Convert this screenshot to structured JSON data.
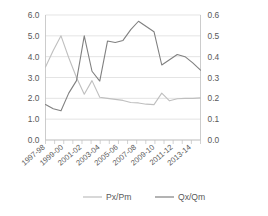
{
  "chart_data": {
    "type": "line",
    "title": "",
    "xlabel": "",
    "ylabel": "",
    "categories": [
      "1997-98",
      "1998-99",
      "1999-00",
      "2000-01",
      "2001-02",
      "2002-03",
      "2003-04",
      "2004-05",
      "2005-06",
      "2006-07",
      "2007-08",
      "2008-09",
      "2009-10",
      "2010-11",
      "2011-12",
      "2012-13",
      "2013-14",
      "2014-15"
    ],
    "x_tick_labels": [
      "1997-98",
      "1999-00",
      "2001-02",
      "2003-04",
      "2005-06",
      "2007-08",
      "2009-10",
      "2011-12",
      "2013-14"
    ],
    "left_axis": {
      "ylim": [
        0.0,
        6.0
      ],
      "ticks": [
        "0.0",
        "1.0",
        "2.0",
        "3.0",
        "4.0",
        "5.0",
        "6.0"
      ],
      "tick_values": [
        0.0,
        1.0,
        2.0,
        3.0,
        4.0,
        5.0,
        6.0
      ]
    },
    "right_axis": {
      "ylim": [
        0.0,
        0.6
      ],
      "ticks": [
        "0.0",
        "0.1",
        "0.2",
        "0.3",
        "0.4",
        "0.5",
        "0.6"
      ],
      "tick_values": [
        0.0,
        0.1,
        0.2,
        0.3,
        0.4,
        0.5,
        0.6
      ]
    },
    "grid": true,
    "legend_position": "bottom",
    "series": [
      {
        "name": "Px/Pm",
        "axis": "left",
        "color": "#bfbfbf",
        "values": [
          3.5,
          4.3,
          5.0,
          3.95,
          3.0,
          2.2,
          2.85,
          2.05,
          2.0,
          1.95,
          1.9,
          1.8,
          1.78,
          1.72,
          1.7,
          2.25,
          1.88,
          1.98
        ]
      },
      {
        "name": "Qx/Qm",
        "axis": "right",
        "color": "#808080",
        "values": [
          0.17,
          0.15,
          0.14,
          0.225,
          0.285,
          0.5,
          0.33,
          0.283,
          0.475,
          0.468,
          0.478,
          0.53,
          0.57,
          0.545,
          0.52,
          0.36,
          0.385,
          0.41
        ]
      }
    ],
    "series_tail": {
      "Px/Pm": [
        2.0,
        2.0,
        2.02
      ],
      "Qx/Qm": [
        0.4,
        0.37,
        0.335
      ]
    }
  },
  "legend": {
    "items": [
      {
        "label": "Px/Pm",
        "color": "#bfbfbf"
      },
      {
        "label": "Qx/Qm",
        "color": "#808080"
      }
    ]
  },
  "colors": {
    "series_light": "#bfbfbf",
    "series_dark": "#808080",
    "grid": "#d9d9d9",
    "axis": "#bfbfbf",
    "text": "#595959",
    "background": "#ffffff"
  }
}
